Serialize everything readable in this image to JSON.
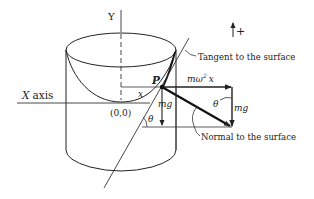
{
  "diagram": {
    "type": "physics-free-body-diagram",
    "labels": {
      "y_axis": "Y",
      "x_axis": "X axis",
      "x_axis_var": "X",
      "x_axis_word": "axis",
      "origin": "(0,0)",
      "point": "P",
      "distance": "x",
      "centrifugal_force": "mω²x",
      "centrifugal_m": "mω",
      "centrifugal_exp": "2",
      "centrifugal_x": "x",
      "weight_small": "mg",
      "weight_triangle": "mg",
      "angle_lower": "θ",
      "angle_triangle": "θ",
      "tangent": "Tangent to the surface",
      "normal": "Normal to the surface",
      "positive_direction": "+"
    },
    "colors": {
      "stroke": "#222222",
      "background": "#ffffff"
    }
  }
}
